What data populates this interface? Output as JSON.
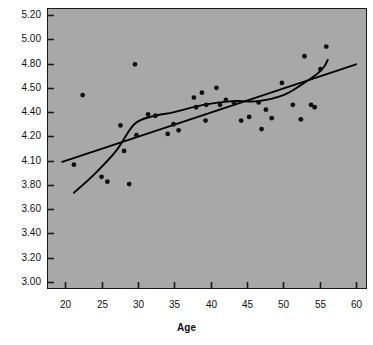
{
  "figure": {
    "plot_background_color": "#a8a8a8",
    "page_background_color": "#ffffff",
    "axis_color": "#1a1a1a",
    "marker_color": "#111111",
    "curve_color": "#000000",
    "plot_left_px": 47,
    "plot_top_px": 8,
    "plot_width_px": 320,
    "plot_height_px": 281
  },
  "chart_data": {
    "type": "scatter",
    "title": "",
    "subtitle": "",
    "xlabel": "Age",
    "ylabel": "",
    "grid": false,
    "legend": "none",
    "xlim": [
      17.5,
      61.5
    ],
    "xticks": [
      20,
      25,
      30,
      35,
      40,
      45,
      50,
      55,
      60
    ],
    "xtick_labels": [
      "20",
      "25",
      "30",
      "35",
      "40",
      "45",
      "50",
      "55",
      "60"
    ],
    "ytick_labels": [
      "5.20",
      "5.00",
      "4.80",
      "4.50",
      "4.40",
      "4.20",
      "4.10",
      "3.80",
      "3.60",
      "3.40",
      "3.20",
      "3.00"
    ],
    "ytick_values": [
      5.2,
      5.0,
      4.8,
      4.5,
      4.4,
      4.2,
      4.1,
      3.8,
      3.6,
      3.4,
      3.2,
      3.0
    ],
    "ytick_note": "tick labels are evenly spaced in pixels though unequal in value",
    "points": [
      {
        "age": 21.2,
        "value": 4.05
      },
      {
        "age": 22.4,
        "value": 4.47
      },
      {
        "age": 25.0,
        "value": 3.9
      },
      {
        "age": 25.8,
        "value": 3.84
      },
      {
        "age": 27.6,
        "value": 4.29
      },
      {
        "age": 28.1,
        "value": 4.14
      },
      {
        "age": 28.8,
        "value": 3.81
      },
      {
        "age": 29.6,
        "value": 4.79
      },
      {
        "age": 29.8,
        "value": 4.21
      },
      {
        "age": 31.4,
        "value": 4.38
      },
      {
        "age": 32.4,
        "value": 4.37
      },
      {
        "age": 34.1,
        "value": 4.22
      },
      {
        "age": 34.9,
        "value": 4.3
      },
      {
        "age": 35.6,
        "value": 4.25
      },
      {
        "age": 37.7,
        "value": 4.46
      },
      {
        "age": 38.0,
        "value": 4.42
      },
      {
        "age": 38.8,
        "value": 4.48
      },
      {
        "age": 39.3,
        "value": 4.33
      },
      {
        "age": 39.4,
        "value": 4.43
      },
      {
        "age": 40.8,
        "value": 4.5
      },
      {
        "age": 41.3,
        "value": 4.43
      },
      {
        "age": 42.1,
        "value": 4.45
      },
      {
        "age": 43.2,
        "value": 4.44
      },
      {
        "age": 44.2,
        "value": 4.33
      },
      {
        "age": 45.3,
        "value": 4.36
      },
      {
        "age": 46.6,
        "value": 4.44
      },
      {
        "age": 47.0,
        "value": 4.26
      },
      {
        "age": 47.6,
        "value": 4.41
      },
      {
        "age": 48.4,
        "value": 4.35
      },
      {
        "age": 49.8,
        "value": 4.56
      },
      {
        "age": 51.3,
        "value": 4.43
      },
      {
        "age": 52.4,
        "value": 4.34
      },
      {
        "age": 52.9,
        "value": 4.86
      },
      {
        "age": 53.8,
        "value": 4.43
      },
      {
        "age": 54.3,
        "value": 4.42
      },
      {
        "age": 55.1,
        "value": 4.73
      },
      {
        "age": 55.9,
        "value": 4.94
      }
    ],
    "series": [
      {
        "name": "linear-fit",
        "type": "line",
        "x": [
          19.6,
          60.0
        ],
        "y": [
          4.085,
          4.79
        ]
      },
      {
        "name": "smooth-fit",
        "type": "curve",
        "x": [
          21.2,
          24.0,
          27.0,
          29.5,
          32.0,
          35.0,
          39.0,
          43.0,
          46.5,
          50.0,
          52.5,
          54.5,
          55.6,
          56.1
        ],
        "y": [
          3.735,
          3.93,
          4.14,
          4.3,
          4.365,
          4.4,
          4.43,
          4.445,
          4.445,
          4.47,
          4.54,
          4.66,
          4.76,
          4.83
        ]
      }
    ]
  }
}
